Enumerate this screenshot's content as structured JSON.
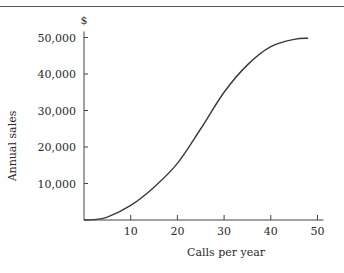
{
  "chart_data": {
    "type": "line",
    "title": "",
    "xlabel": "Calls per year",
    "ylabel": "Annual sales",
    "y_unit": "$",
    "xlim": [
      0,
      50
    ],
    "ylim": [
      0,
      50000
    ],
    "x_ticks": [
      10,
      20,
      30,
      40,
      50
    ],
    "x_tick_labels": [
      "10",
      "20",
      "30",
      "40",
      "50"
    ],
    "y_ticks": [
      10000,
      20000,
      30000,
      40000,
      50000
    ],
    "y_tick_labels": [
      "10,000",
      "20,000",
      "30,000",
      "40,000",
      "50,000"
    ],
    "grid": false,
    "legend": null,
    "series": [
      {
        "name": "Annual sales",
        "x": [
          0,
          2,
          5,
          10,
          15,
          20,
          25,
          30,
          35,
          40,
          45,
          48
        ],
        "y": [
          0,
          100,
          800,
          4000,
          9000,
          15500,
          25000,
          35000,
          42500,
          47500,
          49500,
          49800
        ]
      }
    ]
  }
}
